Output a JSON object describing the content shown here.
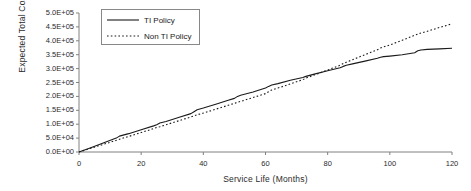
{
  "chart_data": {
    "type": "line",
    "title": "",
    "xlabel": "Service Life (Months)",
    "ylabel": "Expected Total Cost",
    "xlim": [
      0,
      120
    ],
    "ylim": [
      0,
      500000
    ],
    "xticks": [
      0,
      20,
      40,
      60,
      80,
      100,
      120
    ],
    "xtick_labels": [
      "0",
      "20",
      "40",
      "60",
      "80",
      "100",
      "120"
    ],
    "yticks": [
      0,
      50000,
      100000,
      150000,
      200000,
      250000,
      300000,
      350000,
      400000,
      450000,
      500000
    ],
    "ytick_labels": [
      "0.0E+00",
      "5.0E+04",
      "1.0E+05",
      "1.5E+05",
      "2.0E+05",
      "2.5E+05",
      "3.0E+05",
      "3.5E+05",
      "4.0E+05",
      "4.5E+05",
      "5.0E+05"
    ],
    "grid": false,
    "legend_position": "upper-left",
    "x": [
      0,
      4,
      8,
      12,
      13,
      16,
      20,
      24,
      25,
      26,
      28,
      32,
      36,
      37,
      38,
      40,
      44,
      48,
      50,
      51,
      52,
      56,
      60,
      61,
      62,
      64,
      68,
      72,
      73,
      76,
      80,
      84,
      85,
      86,
      88,
      92,
      96,
      97,
      98,
      100,
      104,
      108,
      109,
      110,
      112,
      116,
      120
    ],
    "series": [
      {
        "name": "TI Policy",
        "style": "solid",
        "color": "#1a1a1a",
        "values": [
          0,
          16000,
          33000,
          50000,
          57000,
          66000,
          80000,
          94000,
          98000,
          104000,
          110000,
          124000,
          138000,
          145000,
          152000,
          158000,
          172000,
          186000,
          193000,
          200000,
          204000,
          216000,
          230000,
          236000,
          241000,
          246000,
          258000,
          268000,
          272000,
          281000,
          292000,
          303000,
          308000,
          312000,
          317000,
          327000,
          337000,
          341000,
          343000,
          345000,
          350000,
          357000,
          364000,
          367000,
          369000,
          371000,
          373000
        ]
      },
      {
        "name": "Non TI Policy",
        "style": "dotted",
        "color": "#1a1a1a",
        "values": [
          0,
          14000,
          28000,
          42000,
          46000,
          56000,
          70000,
          84000,
          88000,
          91000,
          98000,
          112000,
          126000,
          130000,
          134000,
          140000,
          154000,
          168000,
          175000,
          179000,
          182000,
          196000,
          210000,
          217000,
          223000,
          230000,
          245000,
          260000,
          266000,
          278000,
          295000,
          312000,
          318000,
          323000,
          332000,
          350000,
          368000,
          374000,
          378000,
          385000,
          402000,
          420000,
          424000,
          428000,
          434000,
          448000,
          461000
        ]
      }
    ]
  }
}
